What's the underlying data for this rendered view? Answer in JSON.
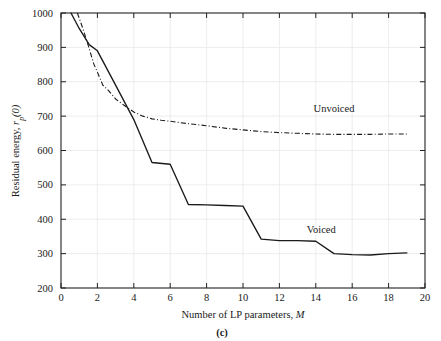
{
  "figure": {
    "caption": "(c)",
    "background": "#ffffff",
    "ink_color": "#1a1a1a",
    "grid_color": "#e9e9e9"
  },
  "chart_data": {
    "type": "line",
    "title": "",
    "xlabel_parts": {
      "main": "Number of LP parameters, ",
      "symbol": "M"
    },
    "ylabel_parts": {
      "main": "Residual energy, ",
      "symbol": "r",
      "sub": "p",
      "tail": "(0)"
    },
    "xlabel": "Number of LP parameters, M",
    "ylabel": "Residual energy, rp(0)",
    "xlim": [
      0,
      20
    ],
    "ylim": [
      200,
      1000
    ],
    "xticks": [
      0,
      2,
      4,
      6,
      8,
      10,
      12,
      14,
      16,
      18,
      20
    ],
    "yticks": [
      200,
      300,
      400,
      500,
      600,
      700,
      800,
      900,
      1000
    ],
    "xtick_labels": [
      "0",
      "2",
      "4",
      "6",
      "8",
      "10",
      "12",
      "14",
      "16",
      "18",
      "20"
    ],
    "ytick_labels": [
      "200",
      "300",
      "400",
      "500",
      "600",
      "700",
      "800",
      "900",
      "1000"
    ],
    "grid": true,
    "legend_position": "inline-annotation",
    "series": [
      {
        "name": "Voiced",
        "style": "solid",
        "label_x": 14.3,
        "label_y": 360,
        "x": [
          0.55,
          1.0,
          1.55,
          2.0,
          3.0,
          4.0,
          5.0,
          6.0,
          7.0,
          8.0,
          9.0,
          10.0,
          11.0,
          12.0,
          13.0,
          14.0,
          15.0,
          16.0,
          17.0,
          18.0,
          19.0
        ],
        "y": [
          1000,
          955,
          908,
          890,
          790,
          690,
          565,
          560,
          443,
          442,
          440,
          438,
          342,
          338,
          338,
          336,
          300,
          297,
          296,
          300,
          302
        ]
      },
      {
        "name": "Unvoiced",
        "style": "dash-dot",
        "label_x": 15.0,
        "label_y": 712,
        "x": [
          0.9,
          1.2,
          1.5,
          1.8,
          2.0,
          2.3,
          2.6,
          3.0,
          3.5,
          4.0,
          4.5,
          5.0,
          5.5,
          6.0,
          7.0,
          8.0,
          9.0,
          10.0,
          11.0,
          12.0,
          13.0,
          14.0,
          15.0,
          16.0,
          17.0,
          18.0,
          19.0
        ],
        "y": [
          1000,
          955,
          905,
          852,
          828,
          790,
          775,
          750,
          730,
          712,
          700,
          692,
          688,
          685,
          678,
          672,
          665,
          660,
          655,
          652,
          650,
          648,
          647,
          647,
          647,
          648,
          648
        ]
      }
    ]
  }
}
